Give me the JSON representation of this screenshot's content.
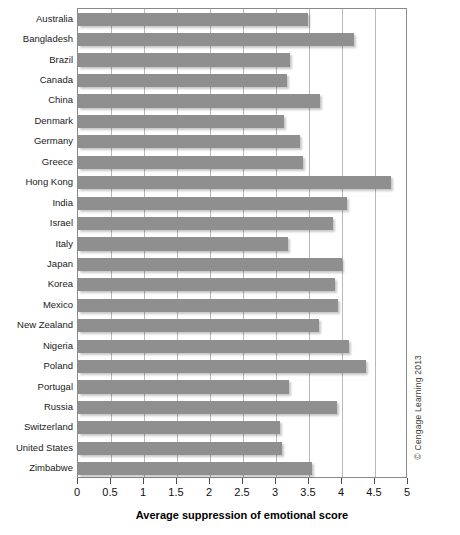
{
  "chart_data": {
    "type": "bar",
    "orientation": "horizontal",
    "title": "",
    "xlabel": "Average suppression of emotional score",
    "ylabel": "",
    "xlim": [
      0,
      5
    ],
    "ylim": null,
    "grid": "vertical gridlines at every x tick",
    "legend": null,
    "bar_color": "#8f8f8f",
    "xticks": [
      "0",
      "0.5",
      "1",
      "1.5",
      "2",
      "2.5",
      "3",
      "3.5",
      "4",
      "4.5",
      "5"
    ],
    "xtick_values": [
      0,
      0.5,
      1,
      1.5,
      2,
      2.5,
      3,
      3.5,
      4,
      4.5,
      5
    ],
    "categories": [
      "Australia",
      "Bangladesh",
      "Brazil",
      "Canada",
      "China",
      "Denmark",
      "Germany",
      "Greece",
      "Hong Kong",
      "India",
      "Israel",
      "Italy",
      "Japan",
      "Korea",
      "Mexico",
      "New Zealand",
      "Nigeria",
      "Poland",
      "Portugal",
      "Russia",
      "Switzerland",
      "United States",
      "Zimbabwe"
    ],
    "values": [
      3.48,
      4.18,
      3.21,
      3.17,
      3.67,
      3.12,
      3.36,
      3.41,
      4.74,
      4.07,
      3.86,
      3.18,
      4.0,
      3.89,
      3.94,
      3.65,
      4.11,
      4.36,
      3.2,
      3.92,
      3.06,
      3.09,
      3.55
    ]
  },
  "credit": {
    "text": "© Cengage Learning 2013"
  }
}
